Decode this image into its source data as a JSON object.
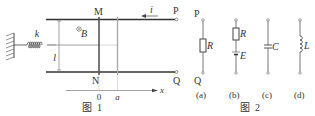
{
  "figure1": {
    "caption": "图  1",
    "labels": {
      "M": "M",
      "N": "N",
      "P": "P",
      "Q": "Q",
      "k": "k",
      "B": "B",
      "l": "l",
      "i": "i",
      "origin": "0",
      "a": "a",
      "x": "x"
    },
    "icons": [
      "fixed-wall-icon",
      "spring-icon",
      "magnetic-field-out-of-page-icon",
      "current-arrow-icon"
    ]
  },
  "figure2": {
    "caption": "图  2",
    "terminals": {
      "top": "P",
      "bottom": "Q"
    },
    "circuits": [
      {
        "id": "a",
        "label": "(a)",
        "components": [
          "R"
        ]
      },
      {
        "id": "b",
        "label": "(b)",
        "components": [
          "R",
          "E"
        ]
      },
      {
        "id": "c",
        "label": "(c)",
        "components": [
          "C"
        ]
      },
      {
        "id": "d",
        "label": "(d)",
        "components": [
          "L"
        ]
      }
    ]
  },
  "colors": {
    "line": "#444444",
    "light_line": "#aaaaaa",
    "text": "#333333"
  }
}
